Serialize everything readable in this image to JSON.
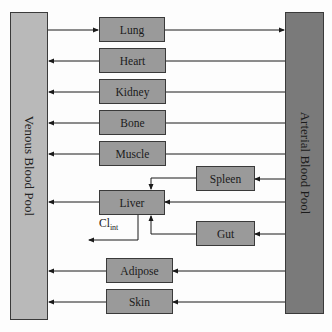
{
  "diagram": {
    "type": "PBPK model schematic",
    "pools": {
      "venous": "Venous Blood Pool",
      "arterial": "Arterial Blood Pool"
    },
    "organs": {
      "lung": "Lung",
      "heart": "Heart",
      "kidney": "Kidney",
      "bone": "Bone",
      "muscle": "Muscle",
      "spleen": "Spleen",
      "liver": "Liver",
      "gut": "Gut",
      "adipose": "Adipose",
      "skin": "Skin"
    },
    "clearance": {
      "base": "Cl",
      "subscript": "int"
    },
    "flows": [
      {
        "from": "Venous Blood Pool",
        "to": "Lung"
      },
      {
        "from": "Lung",
        "to": "Arterial Blood Pool"
      },
      {
        "from": "Arterial Blood Pool",
        "to": "Heart"
      },
      {
        "from": "Heart",
        "to": "Venous Blood Pool"
      },
      {
        "from": "Arterial Blood Pool",
        "to": "Kidney"
      },
      {
        "from": "Kidney",
        "to": "Venous Blood Pool"
      },
      {
        "from": "Arterial Blood Pool",
        "to": "Bone"
      },
      {
        "from": "Bone",
        "to": "Venous Blood Pool"
      },
      {
        "from": "Arterial Blood Pool",
        "to": "Muscle"
      },
      {
        "from": "Muscle",
        "to": "Venous Blood Pool"
      },
      {
        "from": "Arterial Blood Pool",
        "to": "Spleen"
      },
      {
        "from": "Spleen",
        "to": "Liver"
      },
      {
        "from": "Arterial Blood Pool",
        "to": "Liver"
      },
      {
        "from": "Arterial Blood Pool",
        "to": "Gut"
      },
      {
        "from": "Gut",
        "to": "Liver"
      },
      {
        "from": "Liver",
        "to": "Venous Blood Pool"
      },
      {
        "from": "Liver",
        "to": "Clearance (Cl_int)"
      },
      {
        "from": "Arterial Blood Pool",
        "to": "Adipose"
      },
      {
        "from": "Adipose",
        "to": "Venous Blood Pool"
      },
      {
        "from": "Arterial Blood Pool",
        "to": "Skin"
      },
      {
        "from": "Skin",
        "to": "Venous Blood Pool"
      }
    ],
    "colors": {
      "venous_fill": "#b9b9b9",
      "arterial_fill": "#7a7a7a",
      "organ_fill": "#9a9a9a",
      "line": "#1a1a1a"
    }
  }
}
